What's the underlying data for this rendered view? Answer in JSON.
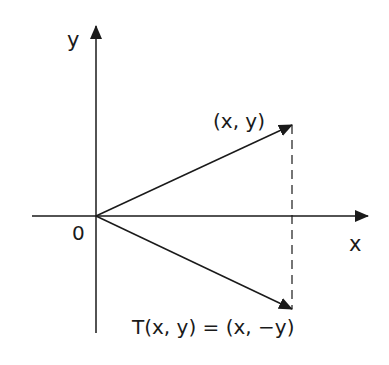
{
  "diagram": {
    "origin_label": "0",
    "x_axis_label": "x",
    "y_axis_label": "y",
    "original_vector_label": "(x, y)",
    "transformed_vector_label": "T(x, y) = (x, −y)",
    "colors": {
      "stroke": "#1a1a1a",
      "background": "#ffffff"
    }
  }
}
